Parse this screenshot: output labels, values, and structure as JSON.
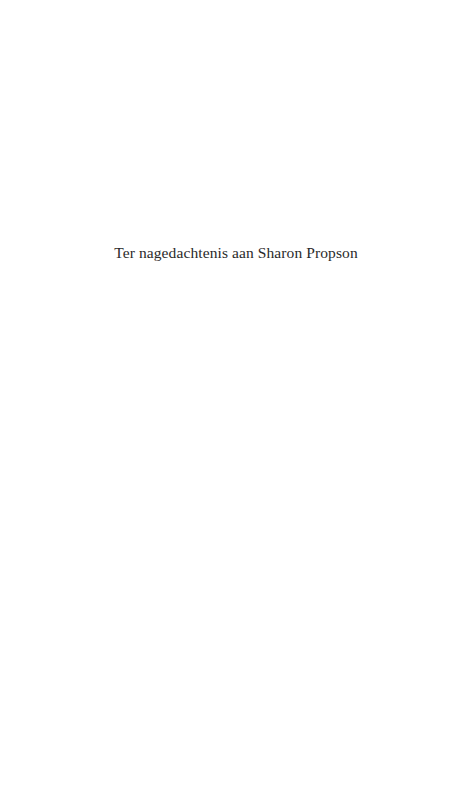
{
  "page": {
    "dedication": "Ter nagedachtenis aan Sharon Propson"
  }
}
